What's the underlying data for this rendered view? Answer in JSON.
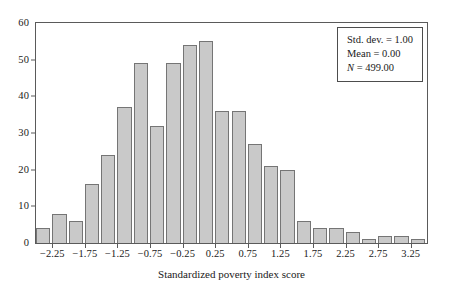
{
  "chart_data": {
    "type": "bar",
    "title": "",
    "xlabel": "Standardized poverty index score",
    "ylabel": "",
    "xlim": [
      -2.5,
      3.5
    ],
    "ylim": [
      0,
      60
    ],
    "grid": false,
    "bin_width": 0.25,
    "categories": [
      "-2.375",
      "-2.125",
      "-1.875",
      "-1.625",
      "-1.375",
      "-1.125",
      "-0.875",
      "-0.625",
      "-0.375",
      "-0.125",
      "0.125",
      "0.375",
      "0.625",
      "0.875",
      "1.125",
      "1.375",
      "1.625",
      "1.875",
      "2.125",
      "2.375",
      "2.625",
      "2.875",
      "3.125",
      "3.375"
    ],
    "values": [
      4,
      8,
      6,
      16,
      24,
      37,
      49,
      32,
      49,
      54,
      55,
      36,
      36,
      27,
      21,
      20,
      6,
      4,
      4,
      3,
      1,
      2,
      2,
      1
    ],
    "x_ticks": [
      "-2.25",
      "-1.75",
      "-1.25",
      "-0.75",
      "-0.25",
      "0.25",
      "0.75",
      "1.25",
      "1.75",
      "2.25",
      "2.75",
      "3.25"
    ],
    "y_ticks": [
      "0",
      "10",
      "20",
      "30",
      "40",
      "50",
      "60"
    ],
    "bar_fill_color": "#c9c9c9",
    "bar_border_color": "#757575"
  },
  "stats": {
    "std_dev": "Std. dev. = 1.00",
    "mean": "Mean = 0.00",
    "n_symbol": "N",
    "n_value": " = 499.00"
  }
}
